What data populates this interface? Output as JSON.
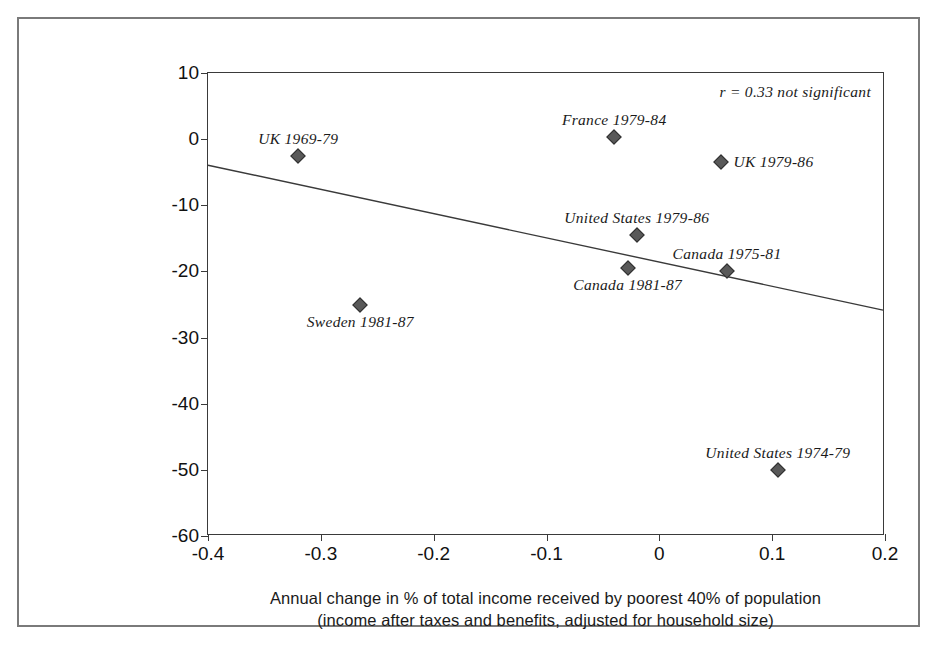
{
  "chart_data": {
    "type": "scatter",
    "title": "",
    "xlabel_line1": "Annual change in % of total income received by poorest 40% of population",
    "xlabel_line2": "(income after taxes and benefits, adjusted for household size)",
    "ylabel": "Annual change in coronary heart disease death rate",
    "xlim": [
      -0.4,
      0.2
    ],
    "ylim": [
      -60,
      10
    ],
    "xticks": [
      "-0.4",
      "-0.3",
      "-0.2",
      "-0.1",
      "0",
      "0.1",
      "0.2"
    ],
    "xtick_values": [
      -0.4,
      -0.3,
      -0.2,
      -0.1,
      0,
      0.1,
      0.2
    ],
    "yticks": [
      "10",
      "0",
      "-10",
      "-20",
      "-30",
      "-40",
      "-50",
      "-60"
    ],
    "ytick_values": [
      10,
      0,
      -10,
      -20,
      -30,
      -40,
      -50,
      -60
    ],
    "grid": false,
    "legend": "none",
    "annotation": "r = 0.33 not significant",
    "marker_color": "#595959",
    "marker_edge_color": "#2f2f2f",
    "marker_shape": "diamond",
    "trendline": {
      "x_start": -0.4,
      "y_start": -4.0,
      "x_end": 0.2,
      "y_end": -26.0,
      "color": "#3a3a3a"
    },
    "points": [
      {
        "label": "UK 1969-79",
        "x": -0.32,
        "y": -2.5,
        "label_pos": "above"
      },
      {
        "label": "Sweden 1981-87",
        "x": -0.265,
        "y": -25.0,
        "label_pos": "below"
      },
      {
        "label": "France 1979-84",
        "x": -0.04,
        "y": 0.3,
        "label_pos": "above"
      },
      {
        "label": "Canada 1981-87",
        "x": -0.028,
        "y": -19.5,
        "label_pos": "below"
      },
      {
        "label": "United States 1979-86",
        "x": -0.02,
        "y": -14.5,
        "label_pos": "above"
      },
      {
        "label": "UK 1979-86",
        "x": 0.055,
        "y": -3.5,
        "label_pos": "right"
      },
      {
        "label": "Canada 1975-81",
        "x": 0.06,
        "y": -20.0,
        "label_pos": "above"
      },
      {
        "label": "United States 1974-79",
        "x": 0.105,
        "y": -50.0,
        "label_pos": "above"
      }
    ]
  },
  "artifact": {
    "top_text": ""
  }
}
